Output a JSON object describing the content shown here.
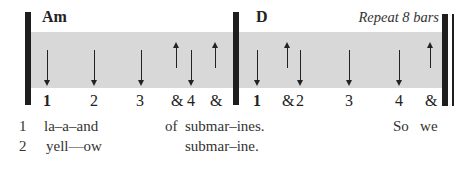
{
  "measures": [
    {
      "chord": "Am",
      "strums": [
        {
          "dir": "down",
          "x": 47
        },
        {
          "dir": "down",
          "x": 94
        },
        {
          "dir": "down",
          "x": 141
        },
        {
          "dir": "up",
          "x": 176
        },
        {
          "dir": "down",
          "x": 191
        },
        {
          "dir": "up",
          "x": 215
        }
      ],
      "counts": [
        {
          "label": "1",
          "x": 43,
          "bold": true
        },
        {
          "label": "2",
          "x": 90
        },
        {
          "label": "3",
          "x": 136
        },
        {
          "label": "&",
          "x": 171
        },
        {
          "label": "4",
          "x": 187
        },
        {
          "label": "&",
          "x": 210
        }
      ]
    },
    {
      "chord": "D",
      "annotation": "Repeat 8 bars",
      "strums": [
        {
          "dir": "down",
          "x": 257
        },
        {
          "dir": "up",
          "x": 287
        },
        {
          "dir": "down",
          "x": 300
        },
        {
          "dir": "down",
          "x": 349
        },
        {
          "dir": "down",
          "x": 399
        },
        {
          "dir": "up",
          "x": 430
        }
      ],
      "counts": [
        {
          "label": "1",
          "x": 253,
          "bold": true
        },
        {
          "label": "&",
          "x": 282
        },
        {
          "label": "2",
          "x": 296
        },
        {
          "label": "3",
          "x": 345
        },
        {
          "label": "4",
          "x": 395
        },
        {
          "label": "&",
          "x": 425
        }
      ]
    }
  ],
  "lyrics": [
    {
      "num": "1",
      "segments": [
        {
          "text": "la–a–and",
          "x": 44
        },
        {
          "text": "of  submar–ines.",
          "x": 165
        },
        {
          "text": "So   we",
          "x": 393
        }
      ]
    },
    {
      "num": "2",
      "segments": [
        {
          "text": "yell—ow",
          "x": 46
        },
        {
          "text": "submar–ine.",
          "x": 185
        }
      ]
    }
  ]
}
